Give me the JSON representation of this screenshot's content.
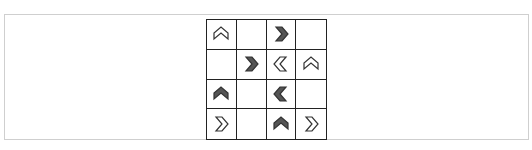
{
  "puzzle": {
    "rows": 4,
    "cols": 4,
    "colors": {
      "filled": "#555555",
      "outline_fill": "#ffffff",
      "stroke": "#333333",
      "grid_line": "#222222",
      "frame": "#cfcfcf"
    },
    "cells": [
      [
        {
          "arrow": "up",
          "style": "outline"
        },
        {
          "arrow": null,
          "style": null
        },
        {
          "arrow": "right",
          "style": "filled"
        },
        {
          "arrow": null,
          "style": null
        }
      ],
      [
        {
          "arrow": null,
          "style": null
        },
        {
          "arrow": "right",
          "style": "filled"
        },
        {
          "arrow": "left",
          "style": "outline"
        },
        {
          "arrow": "up",
          "style": "outline"
        }
      ],
      [
        {
          "arrow": "up",
          "style": "filled"
        },
        {
          "arrow": null,
          "style": null
        },
        {
          "arrow": "left",
          "style": "filled"
        },
        {
          "arrow": null,
          "style": null
        }
      ],
      [
        {
          "arrow": "right",
          "style": "outline"
        },
        {
          "arrow": null,
          "style": null
        },
        {
          "arrow": "up",
          "style": "filled"
        },
        {
          "arrow": "right",
          "style": "outline"
        }
      ]
    ]
  }
}
